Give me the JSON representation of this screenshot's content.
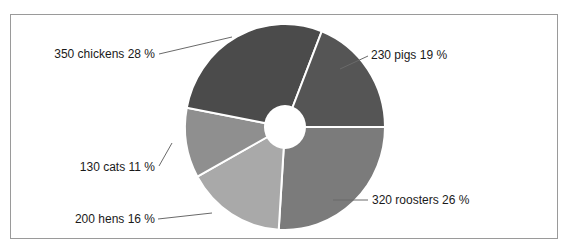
{
  "chart_data": {
    "type": "pie",
    "variant": "donut",
    "title": "",
    "label_format": "{value} {name} {percent} %",
    "slices": [
      {
        "name": "roosters",
        "value": 320,
        "percent": 26,
        "label": "320 roosters 26 %",
        "color": "#7b7b7b"
      },
      {
        "name": "hens",
        "value": 200,
        "percent": 16,
        "label": "200 hens 16 %",
        "color": "#a9a9a9"
      },
      {
        "name": "cats",
        "value": 130,
        "percent": 11,
        "label": "130 cats 11 %",
        "color": "#8f8f8f"
      },
      {
        "name": "chickens",
        "value": 350,
        "percent": 28,
        "label": "350 chickens 28 %",
        "color": "#4b4b4b"
      },
      {
        "name": "pigs",
        "value": 230,
        "percent": 19,
        "label": "230 pigs 19 %",
        "color": "#555555"
      }
    ],
    "legend": "none (leader-line labels)",
    "start_angle": "3 o'clock, clockwise"
  }
}
